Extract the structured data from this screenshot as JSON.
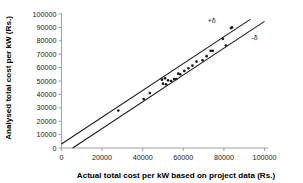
{
  "chart_data": {
    "type": "scatter",
    "title": "",
    "xlabel": "Actual total cost per kW based on project data (Rs.)",
    "ylabel": "Analysed total cost per kW (Rs.)",
    "xlim": [
      0,
      100000
    ],
    "ylim": [
      0,
      100000
    ],
    "xticks": [
      0,
      20000,
      40000,
      60000,
      80000,
      100000
    ],
    "yticks": [
      0,
      10000,
      20000,
      30000,
      40000,
      50000,
      60000,
      70000,
      80000,
      90000,
      100000
    ],
    "xtick_labels": [
      "0",
      "20000",
      "40000",
      "60000",
      "80000",
      "100000"
    ],
    "ytick_labels": [
      "0",
      "10000",
      "20000",
      "30000",
      "40000",
      "50000",
      "60000",
      "70000",
      "80000",
      "90000",
      "100000"
    ],
    "grid": false,
    "legend": false,
    "point_color": "#1a1a1a",
    "line_color": "#1a1a1a",
    "axis_color": "#8c8c8c",
    "series": [
      {
        "name": "Analysed vs actual cost",
        "marker": "dot",
        "points": [
          [
            28000,
            28000
          ],
          [
            40500,
            36500
          ],
          [
            43500,
            41000
          ],
          [
            49500,
            51000
          ],
          [
            50000,
            48000
          ],
          [
            51000,
            52000
          ],
          [
            51500,
            47500
          ],
          [
            52500,
            50500
          ],
          [
            54000,
            50000
          ],
          [
            55500,
            51500
          ],
          [
            56500,
            51500
          ],
          [
            57500,
            55500
          ],
          [
            58500,
            55000
          ],
          [
            60500,
            57500
          ],
          [
            62500,
            59500
          ],
          [
            64500,
            61500
          ],
          [
            66500,
            64500
          ],
          [
            69500,
            65500
          ],
          [
            71500,
            68500
          ],
          [
            73500,
            72500
          ],
          [
            74500,
            72500
          ],
          [
            79500,
            81500
          ],
          [
            81000,
            76500
          ],
          [
            83500,
            89500
          ],
          [
            84000,
            90000
          ]
        ]
      }
    ],
    "annotations": [
      {
        "name": "upper-bound",
        "label": "+δ",
        "type": "line",
        "intercept": 3000,
        "slope": 1.0,
        "x_start": 0,
        "x_end": 93000,
        "label_x": 72000,
        "label_y": 93000
      },
      {
        "name": "lower-bound",
        "label": "-δ",
        "type": "line",
        "intercept": -5500,
        "slope": 1.0,
        "x_start": 5500,
        "x_end": 100000,
        "label_x": 93500,
        "label_y": 80500
      }
    ]
  },
  "figure": {
    "background": "#ffffff",
    "width": 303,
    "height": 183
  }
}
